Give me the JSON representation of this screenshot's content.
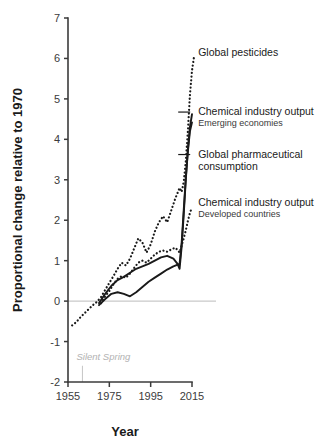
{
  "chart_data": {
    "type": "line",
    "title": "",
    "xlabel": "Year",
    "ylabel": "Proportional change relative to 1970",
    "xlim": [
      1955,
      2015
    ],
    "ylim": [
      -2,
      7
    ],
    "xticks": [
      1955,
      1975,
      1995,
      2015
    ],
    "yticks": [
      -2,
      -1,
      0,
      1,
      2,
      3,
      4,
      5,
      6,
      7
    ],
    "grid": false,
    "legend_position": "inline-right-labels",
    "zero_reference_line": 0,
    "annotations": [
      {
        "text": "Silent Spring",
        "x": 1962,
        "y": -1.45,
        "color": "#b2b2b2",
        "style": "italic"
      }
    ],
    "series": [
      {
        "name": "Global pesticides",
        "label": "Global pesticides",
        "sublabel": "",
        "style": "dotted",
        "color": "#1a1a1a",
        "label_x": 2018,
        "label_y": 6.05,
        "points": [
          [
            1957,
            -0.6
          ],
          [
            1959,
            -0.52
          ],
          [
            1961,
            -0.4
          ],
          [
            1963,
            -0.3
          ],
          [
            1965,
            -0.2
          ],
          [
            1967,
            -0.1
          ],
          [
            1969,
            -0.02
          ],
          [
            1971,
            0.1
          ],
          [
            1973,
            0.28
          ],
          [
            1975,
            0.45
          ],
          [
            1977,
            0.62
          ],
          [
            1979,
            0.8
          ],
          [
            1981,
            0.95
          ],
          [
            1983,
            0.88
          ],
          [
            1985,
            1.05
          ],
          [
            1987,
            1.3
          ],
          [
            1989,
            1.55
          ],
          [
            1991,
            1.45
          ],
          [
            1993,
            1.2
          ],
          [
            1995,
            1.4
          ],
          [
            1997,
            1.72
          ],
          [
            1999,
            1.95
          ],
          [
            2001,
            2.1
          ],
          [
            2003,
            1.95
          ],
          [
            2005,
            2.25
          ],
          [
            2007,
            2.55
          ],
          [
            2009,
            2.8
          ],
          [
            2010,
            2.7
          ],
          [
            2011,
            2.95
          ],
          [
            2012,
            3.45
          ],
          [
            2013,
            4.2
          ],
          [
            2014,
            5.1
          ],
          [
            2015,
            5.7
          ],
          [
            2016,
            6.05
          ]
        ]
      },
      {
        "name": "Chemical industry output, emerging economies",
        "label": "Chemical industry output",
        "sublabel": "Emerging economies",
        "style": "solid",
        "color": "#1a1a1a",
        "label_x": 2018,
        "label_y": 4.6,
        "points": [
          [
            1970,
            -0.05
          ],
          [
            1973,
            0.18
          ],
          [
            1976,
            0.38
          ],
          [
            1979,
            0.52
          ],
          [
            1982,
            0.6
          ],
          [
            1985,
            0.7
          ],
          [
            1988,
            0.8
          ],
          [
            1991,
            0.86
          ],
          [
            1994,
            0.92
          ],
          [
            1997,
            1.0
          ],
          [
            2000,
            1.08
          ],
          [
            2003,
            1.12
          ],
          [
            2006,
            1.05
          ],
          [
            2008,
            0.92
          ],
          [
            2009,
            0.8
          ],
          [
            2010,
            1.35
          ],
          [
            2011,
            2.15
          ],
          [
            2012,
            3.0
          ],
          [
            2013,
            3.75
          ],
          [
            2014,
            4.3
          ],
          [
            2015,
            4.62
          ]
        ]
      },
      {
        "name": "Global pharmaceutical consumption",
        "label": "Global pharmaceutical consumption",
        "sublabel": "",
        "style": "solid",
        "color": "#1a1a1a",
        "label_x": 2018,
        "label_y": 3.55,
        "points": [
          [
            1970,
            -0.1
          ],
          [
            1973,
            0.05
          ],
          [
            1976,
            0.18
          ],
          [
            1979,
            0.22
          ],
          [
            1982,
            0.18
          ],
          [
            1985,
            0.12
          ],
          [
            1988,
            0.22
          ],
          [
            1991,
            0.35
          ],
          [
            1994,
            0.48
          ],
          [
            1997,
            0.58
          ],
          [
            2000,
            0.68
          ],
          [
            2003,
            0.78
          ],
          [
            2006,
            0.86
          ],
          [
            2009,
            0.92
          ],
          [
            2010,
            1.45
          ],
          [
            2011,
            2.25
          ],
          [
            2012,
            3.05
          ],
          [
            2013,
            3.7
          ],
          [
            2014,
            4.2
          ],
          [
            2015,
            4.42
          ]
        ]
      },
      {
        "name": "Chemical industry output, developed countries",
        "label": "Chemical industry output",
        "sublabel": "Developed countries",
        "style": "dotted",
        "color": "#1a1a1a",
        "label_x": 2018,
        "label_y": 2.35,
        "points": [
          [
            1971,
            -0.05
          ],
          [
            1973,
            0.12
          ],
          [
            1975,
            0.25
          ],
          [
            1977,
            0.42
          ],
          [
            1979,
            0.55
          ],
          [
            1981,
            0.62
          ],
          [
            1983,
            0.58
          ],
          [
            1985,
            0.68
          ],
          [
            1987,
            0.82
          ],
          [
            1989,
            0.95
          ],
          [
            1991,
            1.0
          ],
          [
            1993,
            0.95
          ],
          [
            1995,
            1.05
          ],
          [
            1997,
            1.15
          ],
          [
            1999,
            1.22
          ],
          [
            2001,
            1.25
          ],
          [
            2003,
            1.22
          ],
          [
            2005,
            1.28
          ],
          [
            2007,
            1.32
          ],
          [
            2009,
            1.2
          ],
          [
            2010,
            1.38
          ],
          [
            2011,
            1.55
          ],
          [
            2012,
            1.75
          ],
          [
            2013,
            1.98
          ],
          [
            2014,
            2.18
          ],
          [
            2015,
            2.32
          ]
        ]
      }
    ]
  }
}
